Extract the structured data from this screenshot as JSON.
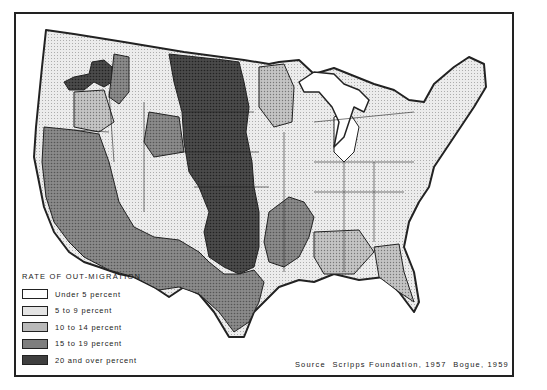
{
  "map": {
    "subject": "Contiguous United States, state economic areas shaded by rate of out-migration",
    "legend": {
      "title": "RATE OF OUT-MIGRATION",
      "items": [
        {
          "label": "Under 5 percent",
          "fill": "#ffffff"
        },
        {
          "label": "5 to 9 percent",
          "fill": "#e4e4e4"
        },
        {
          "label": "10 to 14 percent",
          "fill": "#b9b9b9"
        },
        {
          "label": "15 to 19 percent",
          "fill": "#7e7e7e"
        },
        {
          "label": "20 and over percent",
          "fill": "#3f3f3f"
        }
      ]
    },
    "source": "Source  Scripps Foundation, 1957  Bogue, 1959",
    "colors": {
      "border": "#222222",
      "water": "#ffffff"
    }
  }
}
